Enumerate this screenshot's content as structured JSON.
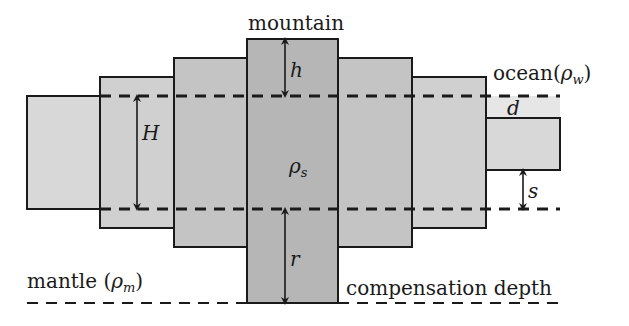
{
  "diagram": {
    "labels": {
      "mountain": "mountain",
      "ocean": "ocean(",
      "ocean_rho": "ρ",
      "ocean_sub": "w",
      "ocean_close": ")",
      "mantle": "mantle (",
      "mantle_rho": "ρ",
      "mantle_sub": "m",
      "mantle_close": ")",
      "compensation_depth": "compensation depth",
      "h": "h",
      "H": "H",
      "rho_s": "ρ",
      "rho_s_sub": "s",
      "r": "r",
      "d": "d",
      "s": "s"
    },
    "colors": {
      "block_light": "#d6d6d6",
      "block_mid": "#c6c6c6",
      "block_dark": "#b4b4b4",
      "ocean_fill": "#e4e4e4",
      "stroke": "#1a1a1a",
      "background": "#ffffff"
    }
  }
}
